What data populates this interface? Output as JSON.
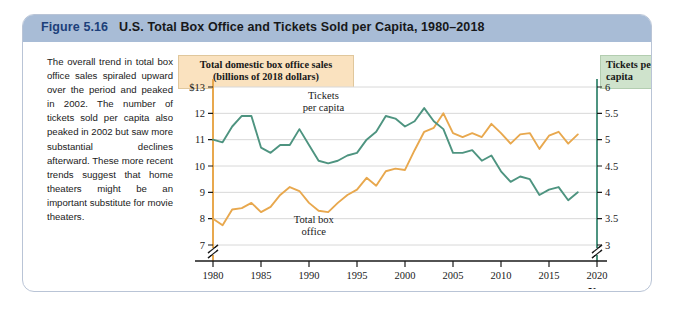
{
  "figure": {
    "label": "Figure",
    "number": "5.16",
    "title": "U.S. Total Box Office and Tickets Sold per Capita, 1980–2018"
  },
  "caption": {
    "text": "The overall trend in total box office sales spiraled upward over the period and peaked in 2002. The number of tickets sold per capita also peaked in 2002 but saw more substantial declines afterward. These more recent trends suggest that home theaters might be an important substitute for movie theaters."
  },
  "legend": {
    "left_box": "Total domestic box office sales (billions of 2018 dollars)",
    "right_box": "Tickets per capita"
  },
  "colors": {
    "box_office": "#e8a84e",
    "tickets": "#4e9480",
    "title_bar": "#a8bcd6",
    "left_legend_bg": "#fae2bf",
    "right_legend_bg": "#cfe3cc",
    "gridline": "#d8d8d8",
    "card_border": "#b9c4d6"
  },
  "chart_data": {
    "type": "line",
    "title": "U.S. Total Box Office and Tickets Sold per Capita, 1980–2018",
    "xlabel": "Year",
    "ylabel": "Total domestic box office sales (billions of 2018 dollars)",
    "y2label": "Tickets per capita",
    "grid": true,
    "legend_position": "inline-annotation",
    "xlim": [
      1980,
      2020
    ],
    "xticks": [
      1980,
      1985,
      1990,
      1995,
      2000,
      2005,
      2010,
      2015,
      2020
    ],
    "ylim": [
      7,
      13
    ],
    "yticks": [
      "$13",
      "12",
      "11",
      "10",
      "9",
      "8",
      "7"
    ],
    "ytick_values": [
      13,
      12,
      11,
      10,
      9,
      8,
      7
    ],
    "y2lim": [
      3,
      6
    ],
    "y2ticks": [
      "6",
      "5.5",
      "5",
      "4.5",
      "4",
      "3.5",
      "3"
    ],
    "y2tick_values": [
      6,
      5.5,
      5,
      4.5,
      4,
      3.5,
      3
    ],
    "axis_break_left": true,
    "axis_break_right": true,
    "annotations": [
      {
        "text": "Tickets per capita",
        "series": "tickets"
      },
      {
        "text": "Total box office",
        "series": "box_office"
      }
    ],
    "x": [
      1980,
      1981,
      1982,
      1983,
      1984,
      1985,
      1986,
      1987,
      1988,
      1989,
      1990,
      1991,
      1992,
      1993,
      1994,
      1995,
      1996,
      1997,
      1998,
      1999,
      2000,
      2001,
      2002,
      2003,
      2004,
      2005,
      2006,
      2007,
      2008,
      2009,
      2010,
      2011,
      2012,
      2013,
      2014,
      2015,
      2016,
      2017,
      2018
    ],
    "series": [
      {
        "name": "Total domestic box office sales (billions of 2018 dollars)",
        "axis": "left",
        "color": "#e8a84e",
        "values": [
          8.0,
          7.75,
          8.35,
          8.4,
          8.6,
          8.25,
          8.45,
          8.9,
          9.2,
          9.05,
          8.6,
          8.3,
          8.25,
          8.6,
          8.9,
          9.1,
          9.55,
          9.25,
          9.8,
          9.9,
          9.85,
          10.6,
          11.3,
          11.45,
          12.0,
          11.25,
          11.1,
          11.25,
          11.1,
          11.6,
          11.25,
          10.85,
          11.2,
          11.25,
          10.65,
          11.15,
          11.3,
          10.85,
          11.2
        ]
      },
      {
        "name": "Tickets per capita",
        "axis": "right",
        "color": "#4e9480",
        "values": [
          5.0,
          4.95,
          5.25,
          5.45,
          5.45,
          4.85,
          4.75,
          4.9,
          4.9,
          5.2,
          4.9,
          4.6,
          4.55,
          4.6,
          4.7,
          4.75,
          5.0,
          5.15,
          5.45,
          5.4,
          5.25,
          5.35,
          5.6,
          5.35,
          5.2,
          4.75,
          4.75,
          4.8,
          4.6,
          4.7,
          4.4,
          4.2,
          4.3,
          4.25,
          3.95,
          4.05,
          4.1,
          3.85,
          4.0
        ]
      }
    ]
  },
  "axis_titles": {
    "x_axis_name": "Year"
  }
}
